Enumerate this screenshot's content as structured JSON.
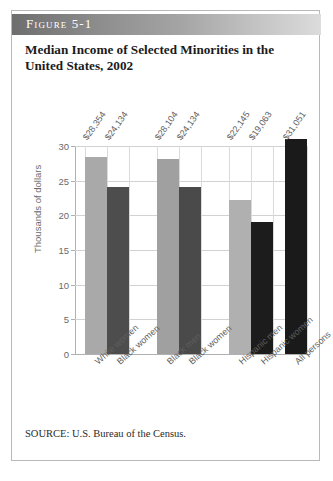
{
  "figure": {
    "header_label": "Figure 5-1",
    "title": "Median Income of Selected Minorities in the United States, 2002",
    "source": "SOURCE: U.S. Bureau of the Census."
  },
  "chart_data": {
    "type": "bar",
    "title": "Median Income of Selected Minorities in the United States, 2002",
    "xlabel": "",
    "ylabel": "Thousands of dollars",
    "ylim": [
      0,
      30
    ],
    "yticks": [
      0,
      5,
      10,
      15,
      20,
      25,
      30
    ],
    "ytick_labels": [
      "0",
      "5",
      "10",
      "15",
      "20",
      "25",
      "30"
    ],
    "grid": true,
    "legend": "none",
    "categories": [
      "White women",
      "Black women",
      "Black men",
      "Black women",
      "Hispanic men",
      "Hispanic women",
      "All persons"
    ],
    "values": [
      28.354,
      24.134,
      28.104,
      24.134,
      22.145,
      19.063,
      31.051
    ],
    "data_labels": [
      "$28,354",
      "$24,134",
      "$28,104",
      "$24,134",
      "$22,145",
      "$19,063",
      "$31,051"
    ],
    "bar_colors": [
      "#a9a9a9",
      "#4d4d4d",
      "#a0a0a0",
      "#4a4a4a",
      "#b0b0b0",
      "#1c1c1c",
      "#1a1a1a"
    ],
    "groups": [
      {
        "label": "women-white-black",
        "indices": [
          0,
          1
        ]
      },
      {
        "label": "black-men-women",
        "indices": [
          2,
          3
        ]
      },
      {
        "label": "hispanic-men-women",
        "indices": [
          4,
          5
        ]
      },
      {
        "label": "all-persons",
        "indices": [
          6
        ]
      }
    ]
  }
}
